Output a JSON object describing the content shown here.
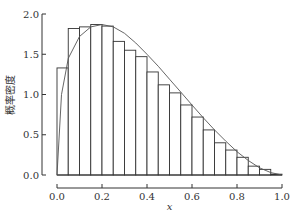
{
  "chart_data": {
    "type": "bar",
    "subtype": "histogram_with_density_curve",
    "title": "",
    "xlabel": "x",
    "ylabel": "概率密度",
    "xlim": [
      0.0,
      1.0
    ],
    "ylim": [
      0.0,
      2.0
    ],
    "x_ticks": [
      "0.0",
      "0.2",
      "0.4",
      "0.6",
      "0.8",
      "1.0"
    ],
    "y_ticks": [
      "0.0",
      "0.5",
      "1.0",
      "1.5",
      "2.0"
    ],
    "grid": false,
    "legend": null,
    "bin_width": 0.05,
    "bin_edges": [
      0.0,
      0.05,
      0.1,
      0.15,
      0.2,
      0.25,
      0.3,
      0.35,
      0.4,
      0.45,
      0.5,
      0.55,
      0.6,
      0.65,
      0.7,
      0.75,
      0.8,
      0.85,
      0.9,
      0.95,
      1.0
    ],
    "values": [
      1.33,
      1.82,
      1.84,
      1.87,
      1.85,
      1.66,
      1.55,
      1.47,
      1.28,
      1.12,
      1.02,
      0.87,
      0.72,
      0.56,
      0.4,
      0.31,
      0.22,
      0.11,
      0.07,
      0.01
    ],
    "series": [
      {
        "name": "histogram",
        "kind": "bar",
        "values": [
          1.33,
          1.82,
          1.84,
          1.87,
          1.85,
          1.66,
          1.55,
          1.47,
          1.28,
          1.12,
          1.02,
          0.87,
          0.72,
          0.56,
          0.4,
          0.31,
          0.22,
          0.11,
          0.07,
          0.01
        ]
      },
      {
        "name": "density_curve",
        "kind": "line",
        "x": [
          0.0,
          0.02,
          0.05,
          0.1,
          0.15,
          0.2,
          0.25,
          0.3,
          0.35,
          0.4,
          0.45,
          0.5,
          0.55,
          0.6,
          0.65,
          0.7,
          0.75,
          0.8,
          0.85,
          0.9,
          0.95,
          1.0
        ],
        "y": [
          0.0,
          1.0,
          1.45,
          1.72,
          1.84,
          1.87,
          1.84,
          1.76,
          1.64,
          1.5,
          1.35,
          1.19,
          1.03,
          0.87,
          0.71,
          0.56,
          0.42,
          0.29,
          0.18,
          0.09,
          0.03,
          0.0
        ]
      }
    ],
    "colors": {
      "bar_edge": "#333333",
      "bar_fill": "#ffffff",
      "curve": "#555555",
      "axis": "#333333"
    }
  }
}
